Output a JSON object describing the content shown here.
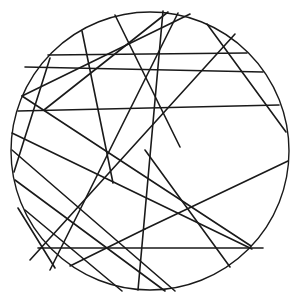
{
  "figure": {
    "stroke_color": "#1a1a1a",
    "background": "#ffffff",
    "circle": {
      "cx": 150,
      "cy": 151,
      "r": 139
    },
    "chords": [
      {
        "x1": 48,
        "y1": 55,
        "x2": 247,
        "y2": 53
      },
      {
        "x1": 25,
        "y1": 67,
        "x2": 263,
        "y2": 72
      },
      {
        "x1": 18,
        "y1": 111,
        "x2": 279,
        "y2": 105
      },
      {
        "x1": 38,
        "y1": 248,
        "x2": 263,
        "y2": 248
      },
      {
        "x1": 50,
        "y1": 58,
        "x2": 14,
        "y2": 172
      },
      {
        "x1": 82,
        "y1": 31,
        "x2": 113,
        "y2": 183
      },
      {
        "x1": 115,
        "y1": 15,
        "x2": 180,
        "y2": 147
      },
      {
        "x1": 207,
        "y1": 24,
        "x2": 286,
        "y2": 132
      },
      {
        "x1": 163,
        "y1": 11,
        "x2": 138,
        "y2": 290
      },
      {
        "x1": 168,
        "y1": 12,
        "x2": 44,
        "y2": 110
      },
      {
        "x1": 190,
        "y1": 14,
        "x2": 22,
        "y2": 96
      },
      {
        "x1": 235,
        "y1": 34,
        "x2": 30,
        "y2": 260
      },
      {
        "x1": 178,
        "y1": 13,
        "x2": 50,
        "y2": 270
      },
      {
        "x1": 288,
        "y1": 161,
        "x2": 145,
        "y2": 229
      },
      {
        "x1": 145,
        "y1": 229,
        "x2": 70,
        "y2": 266
      },
      {
        "x1": 22,
        "y1": 96,
        "x2": 251,
        "y2": 246
      },
      {
        "x1": 12,
        "y1": 133,
        "x2": 252,
        "y2": 249
      },
      {
        "x1": 12,
        "y1": 150,
        "x2": 175,
        "y2": 291
      },
      {
        "x1": 15,
        "y1": 180,
        "x2": 165,
        "y2": 291
      },
      {
        "x1": 25,
        "y1": 210,
        "x2": 122,
        "y2": 291
      },
      {
        "x1": 145,
        "y1": 150,
        "x2": 230,
        "y2": 267
      },
      {
        "x1": 18,
        "y1": 208,
        "x2": 55,
        "y2": 268
      }
    ]
  }
}
